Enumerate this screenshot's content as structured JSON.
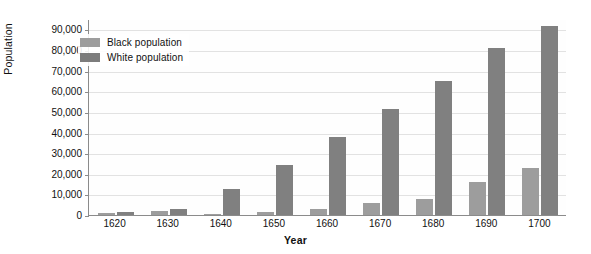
{
  "chart_data": {
    "type": "bar",
    "title": "",
    "xlabel": "Year",
    "ylabel": "Population",
    "categories": [
      "1620",
      "1630",
      "1640",
      "1650",
      "1660",
      "1670",
      "1680",
      "1690",
      "1700"
    ],
    "series": [
      {
        "name": "Black population",
        "color": "#9d9d9d",
        "values": [
          1000,
          2000,
          600,
          1600,
          2900,
          6000,
          7800,
          16000,
          23000
        ]
      },
      {
        "name": "White population",
        "color": "#808080",
        "values": [
          1300,
          3000,
          12500,
          24500,
          38000,
          51500,
          65000,
          81000,
          91500
        ]
      }
    ],
    "ylim": [
      0,
      95000
    ],
    "yticks": [
      "0",
      "10,000",
      "20,000",
      "30,000",
      "40,000",
      "50,000",
      "60,000",
      "70,000",
      "80,000",
      "90,000"
    ],
    "ytick_values": [
      0,
      10000,
      20000,
      30000,
      40000,
      50000,
      60000,
      70000,
      80000,
      90000
    ],
    "grid": true,
    "legend_position": "top-left"
  },
  "legend": {
    "entries": [
      {
        "label": "Black population"
      },
      {
        "label": "White population"
      }
    ]
  },
  "axes": {
    "x_title": "Year",
    "y_title": "Population"
  }
}
